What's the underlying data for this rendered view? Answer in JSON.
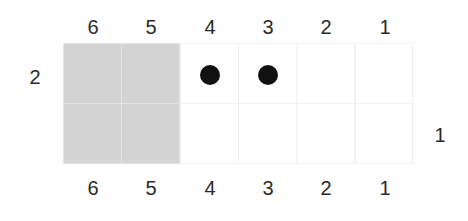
{
  "board": {
    "columns": [
      "6",
      "5",
      "4",
      "3",
      "2",
      "1"
    ],
    "top_labels": [
      "6",
      "5",
      "4",
      "3",
      "2",
      "1"
    ],
    "bottom_labels": [
      "6",
      "5",
      "4",
      "3",
      "2",
      "1"
    ],
    "row_labels": {
      "left": "2",
      "right": "1"
    },
    "rows": [
      {
        "label": "2",
        "cells": [
          {
            "col": "6",
            "shaded": true,
            "piece": null
          },
          {
            "col": "5",
            "shaded": true,
            "piece": null
          },
          {
            "col": "4",
            "shaded": false,
            "piece": "black-dot"
          },
          {
            "col": "3",
            "shaded": false,
            "piece": "black-dot"
          },
          {
            "col": "2",
            "shaded": false,
            "piece": null
          },
          {
            "col": "1",
            "shaded": false,
            "piece": null
          }
        ]
      },
      {
        "label": "1",
        "cells": [
          {
            "col": "6",
            "shaded": true,
            "piece": null
          },
          {
            "col": "5",
            "shaded": true,
            "piece": null
          },
          {
            "col": "4",
            "shaded": false,
            "piece": null
          },
          {
            "col": "3",
            "shaded": false,
            "piece": null
          },
          {
            "col": "2",
            "shaded": false,
            "piece": null
          },
          {
            "col": "1",
            "shaded": false,
            "piece": null
          }
        ]
      }
    ],
    "colors": {
      "shaded": "#d3d3d3",
      "grid_line": "#f0f0f0",
      "piece": "#111111",
      "text": "#2a2a2a"
    }
  }
}
